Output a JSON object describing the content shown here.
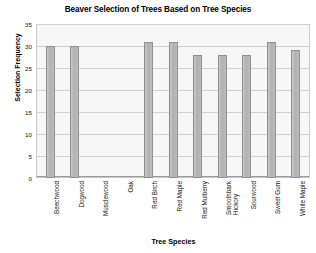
{
  "chart_data": {
    "type": "bar",
    "title": "Beaver Selection of Trees Based on Tree Species",
    "xlabel": "Tree Species",
    "ylabel": "Selection Frequency",
    "categories": [
      "Beechwood",
      "Dogwood",
      "Musclewood",
      "Oak",
      "Red Birch",
      "Red Maple",
      "Red Mulberry",
      "Smoothbark\nHickory",
      "Sourwood",
      "Sweet Gum",
      "White Maple"
    ],
    "values": [
      30,
      30,
      0,
      0,
      31,
      31,
      28,
      28,
      28,
      31,
      29
    ],
    "ylim": [
      0,
      35
    ],
    "yticks": [
      0,
      5,
      10,
      15,
      20,
      25,
      30,
      35
    ],
    "grid": true,
    "legend": null,
    "bar_color": "#b5b5b5",
    "bar_edge_color": "#8f8f8f",
    "plot_background": "#f7f7f7"
  }
}
